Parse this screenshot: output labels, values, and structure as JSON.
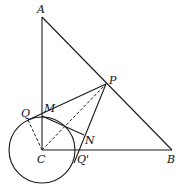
{
  "diagram": {
    "points": {
      "A": {
        "label": "A",
        "x": 42,
        "y": 17
      },
      "B": {
        "label": "B",
        "x": 172,
        "y": 150
      },
      "C": {
        "label": "C",
        "x": 42,
        "y": 150
      },
      "P": {
        "label": "P",
        "x": 106,
        "y": 84
      },
      "M": {
        "label": "M",
        "x": 42,
        "y": 116
      },
      "Q": {
        "label": "Q",
        "x": 28,
        "y": 120
      },
      "N": {
        "label": "N",
        "x": 84,
        "y": 135
      },
      "Qp": {
        "label": "Q'",
        "x": 78,
        "y": 152
      }
    },
    "circle": {
      "center": "C",
      "radius": 33
    },
    "colors": {
      "stroke": "#1a1a1a",
      "background": "#ffffff"
    }
  }
}
